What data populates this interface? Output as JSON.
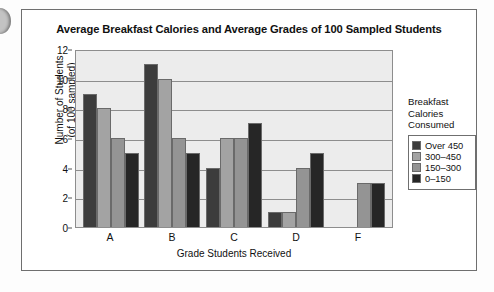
{
  "artifacts": {
    "punch_hole": "page-hole-artifact"
  },
  "chart_data": {
    "type": "bar",
    "title": "Average Breakfast Calories and Average Grades of 100 Sampled Students",
    "xlabel": "Grade Students Received",
    "ylabel": "Number of Students\n(of 100 sampled)",
    "ylabel_line1": "Number of Students",
    "ylabel_line2": "(of 100 sampled)",
    "categories": [
      "A",
      "B",
      "C",
      "D",
      "F"
    ],
    "ylim": [
      0,
      12
    ],
    "yticks": [
      0,
      2,
      4,
      6,
      8,
      10,
      12
    ],
    "grid": true,
    "legend_position": "right",
    "legend_title_lines": [
      "Breakfast",
      "Calories",
      "Consumed"
    ],
    "series": [
      {
        "name": "Over 450",
        "color": "#3c3c3c",
        "values": [
          9,
          11,
          4,
          1,
          0
        ]
      },
      {
        "name": "300–450",
        "color": "#a3a3a3",
        "values": [
          8,
          10,
          6,
          1,
          0
        ]
      },
      {
        "name": "150–300",
        "color": "#949494",
        "values": [
          6,
          6,
          6,
          4,
          3
        ]
      },
      {
        "name": "0–150",
        "color": "#262626",
        "values": [
          5,
          5,
          7,
          5,
          3
        ]
      }
    ]
  }
}
